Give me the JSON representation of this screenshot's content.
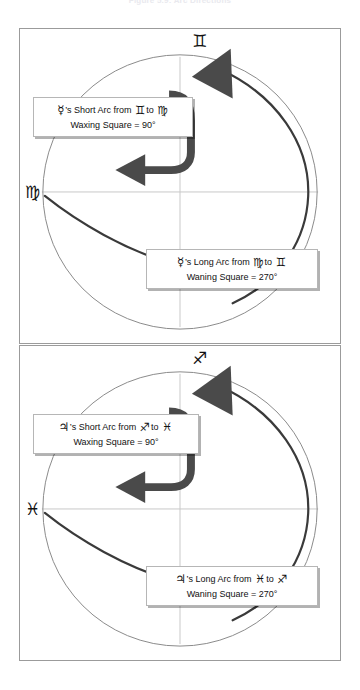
{
  "figure": {
    "title": "Figure 5.9: Arc Directions"
  },
  "colors": {
    "circle_stroke": "#8a8a8a",
    "crosshair": "#c9c9c9",
    "arc_dark": "#3a3a3a",
    "arrow_fill": "#4a4a4a",
    "panel_border": "#9b9b9b",
    "callout_border": "#b6b6b6",
    "text": "#111111"
  },
  "panels": [
    {
      "id": "mercury-panel",
      "planet_symbol": "☿",
      "planet_name": "Mercury",
      "top_sign": {
        "symbol": "♊",
        "name": "Gemini"
      },
      "left_sign": {
        "symbol": "♍",
        "name": "Virgo"
      },
      "short_arc": {
        "planet": "☿",
        "possessive": "’s Short Arc from",
        "from": "♊",
        "to_word": "to",
        "to": "♍",
        "line2": "Waxing Square = 90°",
        "degrees": 90,
        "label": "Waxing Square"
      },
      "long_arc": {
        "planet": "☿",
        "possessive": "’s Long Arc from",
        "from": "♍",
        "to_word": "to",
        "to": "♊",
        "line2": "Waning Square = 270°",
        "degrees": 270,
        "label": "Waning Square"
      }
    },
    {
      "id": "jupiter-panel",
      "planet_symbol": "♃",
      "planet_name": "Jupiter",
      "top_sign": {
        "symbol": "♐",
        "name": "Sagittarius"
      },
      "left_sign": {
        "symbol": "♓",
        "name": "Pisces"
      },
      "short_arc": {
        "planet": "♃",
        "possessive": "’s Short Arc from",
        "from": "♐",
        "to_word": "to",
        "to": "♓",
        "line2": "Waxing Square = 90°",
        "degrees": 90,
        "label": "Waxing Square"
      },
      "long_arc": {
        "planet": "♃",
        "possessive": "’s Long Arc from",
        "from": "♓",
        "to_word": "to",
        "to": "♐",
        "line2": "Waning Square = 270°",
        "degrees": 270,
        "label": "Waning Square"
      }
    }
  ]
}
